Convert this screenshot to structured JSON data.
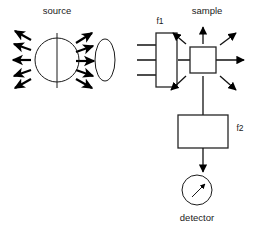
{
  "diagram": {
    "type": "optical-spectroscopy-schematic",
    "canvas": {
      "width": 257,
      "height": 228,
      "background": "#ffffff"
    },
    "stroke_color": "#1a1a1a",
    "labels": {
      "source": "source",
      "filter1": "f1",
      "sample": "sample",
      "filter2": "f2",
      "detector": "detector"
    },
    "components": [
      {
        "id": "source",
        "label": "source",
        "shape": "circle-with-vertical-line",
        "cx": 57,
        "cy": 60,
        "r": 22,
        "emission": "isotropic-arrows",
        "arrows_left": 5,
        "arrows_right": 5
      },
      {
        "id": "lens",
        "label": "",
        "shape": "ellipse",
        "cx": 105,
        "cy": 60,
        "rx": 10,
        "ry": 21
      },
      {
        "id": "filter1",
        "label": "f1",
        "shape": "rectangle-tall",
        "x": 156,
        "y": 33,
        "width": 21,
        "height": 54,
        "input_beams": 3
      },
      {
        "id": "sample",
        "label": "sample",
        "shape": "rectangle-square",
        "x": 190,
        "y": 47,
        "width": 26,
        "height": 26,
        "scattering": "8-direction-arrows"
      },
      {
        "id": "filter2",
        "label": "f2",
        "shape": "rectangle-wide",
        "x": 178,
        "y": 115,
        "width": 50,
        "height": 33
      },
      {
        "id": "detector",
        "label": "detector",
        "shape": "circle-meter-with-needle",
        "cx": 197,
        "cy": 190,
        "r": 15,
        "needle_direction": "up-right"
      }
    ],
    "beam_paths": [
      {
        "from": "source",
        "to": "filter1",
        "orientation": "horizontal",
        "style": "multi-ray"
      },
      {
        "from": "filter1",
        "to": "sample",
        "orientation": "horizontal",
        "style": "single-ray"
      },
      {
        "from": "sample",
        "to": "right",
        "orientation": "horizontal",
        "style": "transmitted"
      },
      {
        "from": "sample",
        "to": "filter2",
        "orientation": "vertical-down",
        "style": "scattered"
      },
      {
        "from": "filter2",
        "to": "detector",
        "orientation": "vertical-down",
        "style": "single-ray"
      }
    ]
  }
}
